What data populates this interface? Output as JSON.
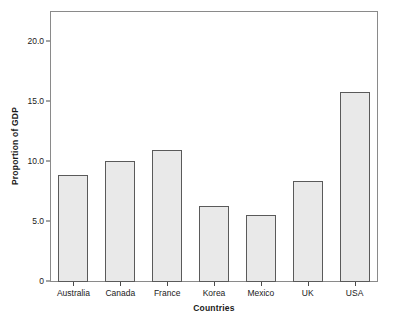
{
  "chart_data": {
    "type": "bar",
    "title": "",
    "xlabel": "Countries",
    "ylabel": "Proportion of GDP",
    "categories": [
      "Australia",
      "Canada",
      "France",
      "Korea",
      "Mexico",
      "UK",
      "USA"
    ],
    "values": [
      8.9,
      10.1,
      11.0,
      6.3,
      5.6,
      8.4,
      15.8
    ],
    "ylim": [
      0,
      22.5
    ],
    "yticks": [
      0,
      5.0,
      10.0,
      15.0,
      20.0
    ],
    "ytick_labels": [
      "0",
      "5.0",
      "10.0",
      "15.0",
      "20.0"
    ],
    "grid": false,
    "legend": null,
    "bar_fill_color": "#e9e9e9",
    "bar_edge_color": "#5a5a5a",
    "frame_color": "#8a8a8a",
    "text_color": "#1a1a1a",
    "background_color": "#ffffff"
  }
}
